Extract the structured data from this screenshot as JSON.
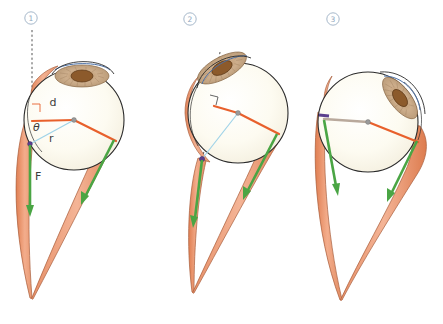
{
  "figure": {
    "name": "eye-muscle-force-diagram",
    "background": "#ffffff",
    "width": 443,
    "height": 324
  },
  "colors": {
    "muscle_fill": "#ef9a76",
    "muscle_fill_light": "#f3b394",
    "muscle_stroke": "#b5643f",
    "arrow_green": "#4aa544",
    "line_orange": "#e8602c",
    "line_blue": "#9fd3e8",
    "line_gray": "#b9a99c",
    "sclera": "#fdfbf2",
    "sclera_stroke": "#2b2b2b",
    "iris": "#c9a988",
    "iris_stroke": "#8a6a49",
    "pupil": "#8c5a2b",
    "pupil_stroke": "#5a3716",
    "cornea_blue": "#4a6fa5",
    "marker_purple": "#5b3f8e",
    "dashed": "#555555",
    "hub": "#9a9a9a",
    "panel_number": "#8fa6bd",
    "label_text": "#3c3c3c"
  },
  "panels": [
    {
      "id": "panel-1",
      "number": "1",
      "number_x": 31,
      "number_y": 21,
      "labels": [
        {
          "name": "label-d",
          "text": "d",
          "x": 53,
          "y": 106,
          "italic": false
        },
        {
          "name": "label-theta",
          "text": "θ",
          "x": 33,
          "y": 131,
          "italic": true
        },
        {
          "name": "label-r",
          "text": "r",
          "x": 49,
          "y": 142,
          "italic": false
        },
        {
          "name": "label-F",
          "text": "F",
          "x": 35,
          "y": 180,
          "italic": false
        }
      ],
      "has_dashed_axis": true,
      "has_right_angle": true,
      "left_radius_color": "#9fd3e8",
      "horizontal_line_color": "#e8602c"
    },
    {
      "id": "panel-2",
      "number": "2",
      "number_x": 190,
      "number_y": 22,
      "labels": [],
      "has_dashed_axis": true,
      "has_right_angle": true,
      "left_radius_color": "#9fd3e8",
      "horizontal_line_color": "#e8602c"
    },
    {
      "id": "panel-3",
      "number": "3",
      "number_x": 333,
      "number_y": 22,
      "labels": [],
      "has_dashed_axis": false,
      "has_right_angle": false,
      "left_radius_color": "#b9a99c",
      "horizontal_line_color": "#e8602c"
    }
  ],
  "legend_notes": {
    "d_meaning": "d",
    "r_meaning": "r",
    "theta_meaning": "θ",
    "F_meaning": "F"
  }
}
